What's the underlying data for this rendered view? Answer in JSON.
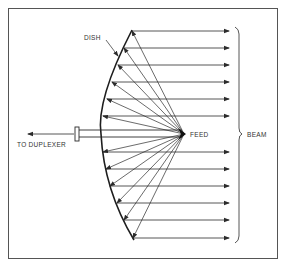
{
  "diagram": {
    "type": "parabolic-dish-antenna",
    "labels": {
      "dish": "DISH",
      "feed": "FEED",
      "beam": "BEAM",
      "duplexer": "TO DUPLEXER"
    },
    "colors": {
      "stroke": "#2b2b2b",
      "border": "#555555",
      "background": "#ffffff"
    },
    "feed_point": [
      184,
      134
    ],
    "dish_points": [
      [
        132,
        31
      ],
      [
        124,
        48
      ],
      [
        118,
        65
      ],
      [
        112,
        82
      ],
      [
        107,
        99
      ],
      [
        103,
        116
      ],
      [
        103,
        152
      ],
      [
        106,
        169
      ],
      [
        110,
        186
      ],
      [
        117,
        203
      ],
      [
        124,
        220
      ],
      [
        133,
        238
      ]
    ],
    "ray_end_x": 229
  }
}
